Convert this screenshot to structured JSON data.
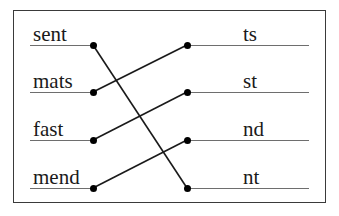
{
  "diagram": {
    "frame_color": "#3a3a3a",
    "rule_color": "#6e6e6e",
    "line_color": "#1a1a1a",
    "dot_color": "#000000",
    "left_column": [
      {
        "id": "left-1",
        "label": "sent",
        "dot_x": 93,
        "dot_y": 45,
        "rule_x": 30,
        "rule_w": 63,
        "label_x": 33,
        "label_y": 24
      },
      {
        "id": "left-2",
        "label": "mats",
        "dot_x": 93,
        "dot_y": 92,
        "rule_x": 30,
        "rule_w": 63,
        "label_x": 33,
        "label_y": 71
      },
      {
        "id": "left-3",
        "label": "fast",
        "dot_x": 93,
        "dot_y": 140,
        "rule_x": 30,
        "rule_w": 63,
        "label_x": 33,
        "label_y": 119
      },
      {
        "id": "left-4",
        "label": "mend",
        "dot_x": 93,
        "dot_y": 188,
        "rule_x": 30,
        "rule_w": 63,
        "label_x": 33,
        "label_y": 167
      }
    ],
    "right_column": [
      {
        "id": "right-1",
        "label": "ts",
        "dot_x": 187,
        "dot_y": 45,
        "rule_x": 187,
        "rule_w": 122,
        "label_x": 243,
        "label_y": 24
      },
      {
        "id": "right-2",
        "label": "st",
        "dot_x": 187,
        "dot_y": 92,
        "rule_x": 187,
        "rule_w": 122,
        "label_x": 243,
        "label_y": 71
      },
      {
        "id": "right-3",
        "label": "nd",
        "dot_x": 187,
        "dot_y": 140,
        "rule_x": 187,
        "rule_w": 122,
        "label_x": 243,
        "label_y": 119
      },
      {
        "id": "right-4",
        "label": "nt",
        "dot_x": 187,
        "dot_y": 188,
        "rule_x": 187,
        "rule_w": 122,
        "label_x": 243,
        "label_y": 167
      }
    ],
    "connections": [
      {
        "id": "conn-sent-nt",
        "from": "sent",
        "to": "nt",
        "x1": 93,
        "y1": 45,
        "x2": 187,
        "y2": 188
      },
      {
        "id": "conn-mats-ts",
        "from": "mats",
        "to": "ts",
        "x1": 93,
        "y1": 92,
        "x2": 187,
        "y2": 45
      },
      {
        "id": "conn-fast-st",
        "from": "fast",
        "to": "st",
        "x1": 93,
        "y1": 140,
        "x2": 187,
        "y2": 92
      },
      {
        "id": "conn-mend-nd",
        "from": "mend",
        "to": "nd",
        "x1": 93,
        "y1": 188,
        "x2": 187,
        "y2": 140
      }
    ]
  }
}
